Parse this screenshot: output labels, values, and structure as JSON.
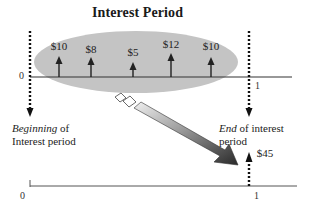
{
  "title": "Interest Period",
  "top_timeline": {
    "start_tick": "0",
    "end_tick": "1",
    "cash_flows": [
      {
        "amount": "$10",
        "x": 59
      },
      {
        "amount": "$8",
        "x": 91
      },
      {
        "amount": "$5",
        "x": 133
      },
      {
        "amount": "$12",
        "x": 171
      },
      {
        "amount": "$10",
        "x": 211
      }
    ]
  },
  "beginning_label": {
    "emph": "Beginning",
    "rest": " of",
    "line2": "Interest period"
  },
  "end_label": {
    "emph": "End",
    "rest": " of interest",
    "line2": "period"
  },
  "bottom_timeline": {
    "start_tick": "0",
    "end_tick": "1",
    "total_amount": "$45"
  },
  "colors": {
    "ellipse_fill": "#c4c4c4",
    "line": "#333333",
    "arrow_dark": "#2e2e2e",
    "arrow_light": "#e6e6e6"
  }
}
